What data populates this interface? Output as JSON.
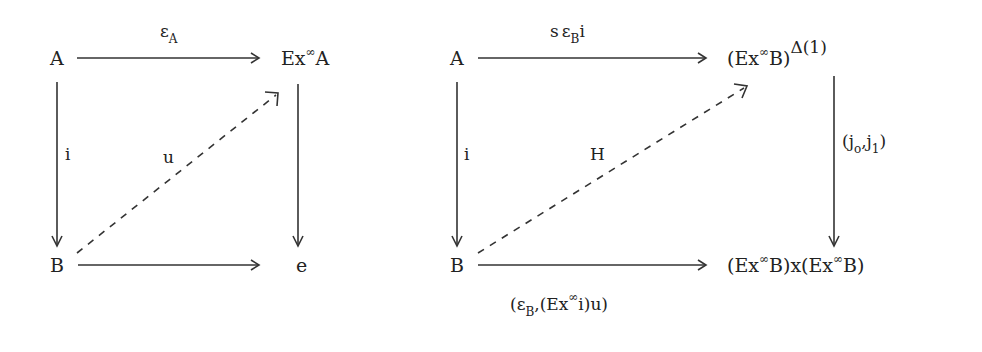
{
  "diagrams": [
    {
      "name": "left-square",
      "nodes": {
        "top_left": "A",
        "top_right_base": "Ex",
        "top_right_sup": "∞",
        "top_right_obj": "A",
        "bottom_left": "B",
        "bottom_right": "e"
      },
      "edges": {
        "top": {
          "main": "ε",
          "sub": "A"
        },
        "left": "i",
        "diagonal": "u",
        "right": "",
        "bottom": ""
      }
    },
    {
      "name": "right-square",
      "nodes": {
        "top_left": "A",
        "top_right": {
          "paren_open": "(",
          "base": "Ex",
          "sup": "∞",
          "obj": "B",
          "paren_close": ")",
          "exp": "Δ(1)"
        },
        "bottom_left": "B",
        "bottom_right": {
          "left": "(Ex",
          "sup1": "∞",
          "mid": "B)x(Ex",
          "sup2": "∞",
          "right": "B)"
        }
      },
      "edges": {
        "top": {
          "pre": "s",
          "main": "ε",
          "sub": "B",
          "post": "i"
        },
        "left": "i",
        "diagonal": "H",
        "right": {
          "open": "(j",
          "sub0": "o",
          "comma": ",j",
          "sub1": "1",
          "close": ")"
        },
        "bottom": {
          "open": "(ε",
          "sub": "B",
          "mid": ",(Ex",
          "sup": "∞",
          "rest": "i)u)"
        }
      }
    }
  ]
}
